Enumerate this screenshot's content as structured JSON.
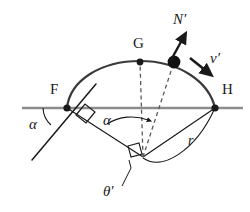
{
  "figure": {
    "type": "geometry-diagram",
    "background_color": "#ffffff",
    "stroke_color": "#1a1a1a",
    "horizontal_line_color": "#808080",
    "labels": {
      "point_f": "F",
      "point_g": "G",
      "point_h": "H",
      "alpha_left": "α",
      "alpha_center": "α",
      "theta_prime": "θ′",
      "normal_force": "N′",
      "velocity": "v′",
      "radius": "r"
    },
    "points": {
      "F": {
        "x": 67,
        "y": 108,
        "marker": "filled-dot"
      },
      "G": {
        "x": 140,
        "y": 62,
        "marker": "filled-dot"
      },
      "H": {
        "x": 215,
        "y": 108,
        "marker": "filled-dot"
      },
      "particle": {
        "x": 174,
        "y": 62,
        "marker": "large-filled-dot"
      },
      "center": {
        "x": 143,
        "y": 157,
        "marker": "vertex"
      }
    },
    "markers": {
      "right_angle_at_f": true,
      "right_angle_at_center": true,
      "dashed_radius_to_g": true,
      "dashed_radius_to_particle": true
    },
    "arrows": {
      "normal": {
        "from_x": 172,
        "from_y": 62,
        "to_x": 183,
        "to_y": 38
      },
      "velocity": {
        "from_x": 191,
        "from_y": 59,
        "to_x": 206,
        "to_y": 71
      },
      "alpha_center": {
        "to_x": 149,
        "to_y": 119
      }
    }
  }
}
